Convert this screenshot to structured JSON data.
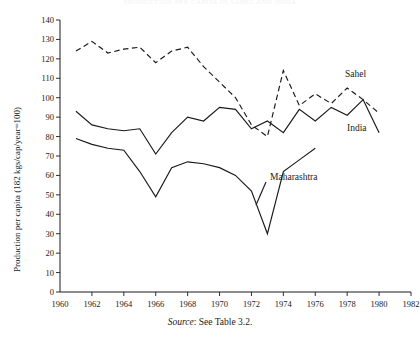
{
  "figure": {
    "title": "PRODUCTION PER CAPITA IN SAHEL AND INDIA",
    "source_label": "Source",
    "source_text": ": See Table 3.2."
  },
  "annotations": {
    "sahel": "Sahel",
    "india": "India",
    "maharashtra": "Maharashtra"
  },
  "chart_data": {
    "type": "line",
    "title": "PRODUCTION PER CAPITA IN SAHEL AND INDIA",
    "xlabel": "",
    "ylabel": "Production per capita (182 kgs/cap/year=100)",
    "xlim": [
      1960,
      1982
    ],
    "ylim": [
      0,
      140
    ],
    "xticks": [
      1960,
      1962,
      1964,
      1966,
      1968,
      1970,
      1972,
      1974,
      1976,
      1978,
      1980,
      1982
    ],
    "yticks": [
      0,
      10,
      20,
      30,
      40,
      50,
      60,
      70,
      80,
      90,
      100,
      110,
      120,
      130,
      140
    ],
    "grid": false,
    "legend": "inline-annotations",
    "series": [
      {
        "name": "Sahel",
        "style": "dashed",
        "x": [
          1961,
          1962,
          1963,
          1964,
          1965,
          1966,
          1967,
          1968,
          1969,
          1970,
          1971,
          1972,
          1973,
          1974,
          1975,
          1976,
          1977,
          1978,
          1979,
          1980
        ],
        "values": [
          124,
          129,
          123,
          125,
          126,
          118,
          124,
          126,
          116,
          108,
          100,
          86,
          80,
          114,
          96,
          102,
          97,
          105,
          99,
          92
        ]
      },
      {
        "name": "India",
        "style": "solid",
        "x": [
          1961,
          1962,
          1963,
          1964,
          1965,
          1966,
          1967,
          1968,
          1969,
          1970,
          1971,
          1972,
          1973,
          1974,
          1975,
          1976,
          1977,
          1978,
          1979,
          1980
        ],
        "values": [
          93,
          86,
          84,
          83,
          84,
          71,
          82,
          90,
          88,
          95,
          94,
          84,
          88,
          82,
          94,
          88,
          95,
          91,
          99,
          82
        ]
      },
      {
        "name": "Maharashtra",
        "style": "solid",
        "x": [
          1961,
          1962,
          1963,
          1964,
          1965,
          1966,
          1967,
          1968,
          1969,
          1970,
          1971,
          1972,
          1973,
          1974,
          1975,
          1976
        ],
        "values": [
          79,
          76,
          74,
          73,
          62,
          49,
          64,
          67,
          66,
          64,
          60,
          52,
          30,
          62,
          68,
          74
        ]
      }
    ]
  }
}
